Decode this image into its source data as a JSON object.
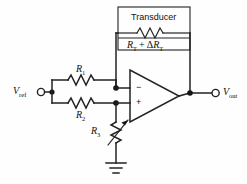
{
  "diagram": {
    "type": "schematic",
    "background_color": "#fefefe",
    "line_color": "#222222"
  },
  "transducer_box": {
    "label": "Transducer",
    "resistor_label_main": "R",
    "resistor_label_main_sub": "T",
    "plus": "+",
    "delta": "Δ",
    "resistor_label_delta": "R",
    "resistor_label_delta_sub": "T",
    "element": "resistor-zigzag"
  },
  "terminals": {
    "input": {
      "label_main": "V",
      "label_sub": "ref",
      "symbol": "open-circle"
    },
    "output": {
      "label_main": "V",
      "label_sub": "out",
      "symbol": "open-circle"
    }
  },
  "components": [
    {
      "id": "R1",
      "label_main": "R",
      "label_sub": "1",
      "kind": "resistor"
    },
    {
      "id": "R2",
      "label_main": "R",
      "label_sub": "2",
      "kind": "resistor"
    },
    {
      "id": "R3",
      "label_main": "R",
      "label_sub": "3",
      "kind": "variable-resistor"
    }
  ],
  "opamp": {
    "inverting_sign": "−",
    "noninverting_sign": "+",
    "shape": "triangle"
  },
  "ground": {
    "symbol": "earth-ground",
    "bars": 3
  }
}
